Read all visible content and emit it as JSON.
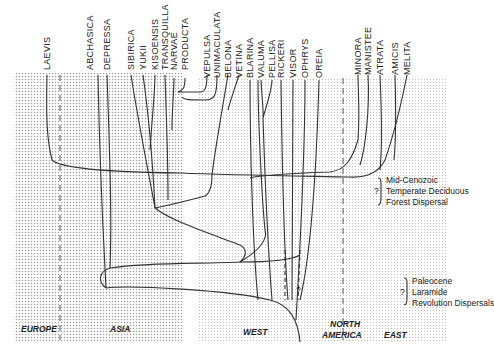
{
  "diagram": {
    "type": "phylogenetic-biogeography",
    "taxa": [
      {
        "name": "LAEVIS",
        "x": 47
      },
      {
        "name": "ABCHASICA",
        "x": 90
      },
      {
        "name": "DEPRESSA",
        "x": 107
      },
      {
        "name": "SIBIRICA",
        "x": 131
      },
      {
        "name": "YUKII",
        "x": 143
      },
      {
        "name": "KISOENSIS",
        "x": 155
      },
      {
        "name": "TRANSQUILLA",
        "x": 165
      },
      {
        "name": "NARVAE",
        "x": 174
      },
      {
        "name": "PRODUCTA",
        "x": 185
      },
      {
        "name": "VEPULSA",
        "x": 207
      },
      {
        "name": "UNIMACULATA",
        "x": 217
      },
      {
        "name": "BELONA",
        "x": 228
      },
      {
        "name": "VETINA",
        "x": 239
      },
      {
        "name": "BLARINA",
        "x": 250
      },
      {
        "name": "VALUMA",
        "x": 261
      },
      {
        "name": "PELLISA",
        "x": 272
      },
      {
        "name": "RICKERI",
        "x": 281
      },
      {
        "name": "VISOR",
        "x": 293
      },
      {
        "name": "OPHRYS",
        "x": 305
      },
      {
        "name": "OREIA",
        "x": 319
      },
      {
        "name": "MINORA",
        "x": 358
      },
      {
        "name": "MANISTEE",
        "x": 368
      },
      {
        "name": "ATRATA",
        "x": 380
      },
      {
        "name": "AMICIS",
        "x": 395
      },
      {
        "name": "MELITA",
        "x": 407
      }
    ],
    "regions": [
      {
        "name": "EUROPE",
        "x": 22
      },
      {
        "name": "ASIA",
        "x": 110
      },
      {
        "name": "WEST",
        "x": 245
      },
      {
        "name": "NORTH\nAMERICA",
        "line1": "NORTH",
        "line2": "AMERICA"
      },
      {
        "name": "EAST",
        "x": 384
      }
    ],
    "annotations": {
      "upper": {
        "lines": [
          "Mid-Cenozoic",
          "Temperate Deciduous",
          "Forest Dispersal"
        ],
        "mark": "?"
      },
      "lower": {
        "lines": [
          "Paleocene",
          "Laramide",
          "Revolution Dispersals"
        ],
        "mark": "?"
      }
    },
    "uncertain_marks": [
      "?",
      "?"
    ]
  },
  "labels": {
    "europe": "EUROPE",
    "asia": "ASIA",
    "west": "WEST",
    "na1": "NORTH",
    "na2": "AMERICA",
    "east": "EAST",
    "up1": "Mid-Cenozoic",
    "up2": "Temperate Deciduous",
    "up3": "Forest Dispersal",
    "lo1": "Paleocene",
    "lo2": "Laramide",
    "lo3": "Revolution Dispersals",
    "q": "?"
  }
}
